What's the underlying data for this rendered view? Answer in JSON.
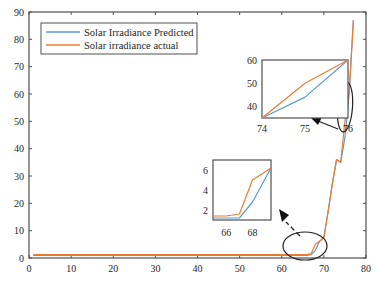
{
  "chart_data": [
    {
      "id": "main",
      "type": "line",
      "title": "",
      "xlabel": "",
      "ylabel": "",
      "xlim": [
        0,
        80
      ],
      "ylim": [
        0,
        90
      ],
      "xticks": [
        0,
        10,
        20,
        30,
        40,
        50,
        60,
        70,
        80
      ],
      "yticks": [
        0,
        10,
        20,
        30,
        40,
        50,
        60,
        70,
        80,
        90
      ],
      "grid": false,
      "legend_position": "upper left",
      "series": [
        {
          "name": "Solar Irradiance Predicted",
          "color": "#5b9bd5",
          "x": [
            1,
            10,
            20,
            30,
            40,
            50,
            60,
            65,
            66,
            67,
            68,
            69,
            70,
            71,
            72,
            73,
            74,
            75,
            76,
            77
          ],
          "y": [
            1,
            1,
            1,
            1,
            1,
            1,
            1,
            1,
            1,
            1.2,
            2.8,
            6.2,
            7.5,
            17,
            27,
            36,
            35,
            44,
            60,
            87
          ]
        },
        {
          "name": "Solar irradiance actual",
          "color": "#ed7d31",
          "x": [
            1,
            10,
            20,
            30,
            40,
            50,
            60,
            65,
            66,
            67,
            68,
            69,
            70,
            71,
            72,
            73,
            74,
            75,
            76,
            77
          ],
          "y": [
            1.2,
            1.2,
            1.2,
            1.2,
            1.2,
            1.2,
            1.2,
            1.2,
            1.2,
            1.6,
            5,
            6.2,
            7.5,
            17,
            27,
            36,
            35,
            50,
            60,
            87
          ]
        }
      ]
    },
    {
      "id": "inset-top",
      "type": "line",
      "xlim": [
        74,
        76
      ],
      "ylim": [
        35,
        60
      ],
      "xticks": [
        74,
        75,
        76
      ],
      "yticks": [
        40,
        50,
        60
      ],
      "series": [
        {
          "name": "Solar Irradiance Predicted",
          "color": "#5b9bd5",
          "x": [
            74,
            75,
            76
          ],
          "y": [
            35,
            44,
            60
          ]
        },
        {
          "name": "Solar irradiance actual",
          "color": "#ed7d31",
          "x": [
            74,
            75,
            76
          ],
          "y": [
            35,
            50,
            60
          ]
        }
      ]
    },
    {
      "id": "inset-bottom",
      "type": "line",
      "xlim": [
        65,
        69.4
      ],
      "ylim": [
        1,
        7
      ],
      "xticks": [
        66,
        68
      ],
      "yticks": [
        2,
        4,
        6
      ],
      "series": [
        {
          "name": "Solar Irradiance Predicted",
          "color": "#5b9bd5",
          "x": [
            65,
            66,
            67,
            68,
            69.4
          ],
          "y": [
            1.2,
            1.2,
            1.2,
            2.8,
            6.2
          ]
        },
        {
          "name": "Solar irradiance actual",
          "color": "#ed7d31",
          "x": [
            65,
            66,
            67,
            68,
            69.4
          ],
          "y": [
            1.4,
            1.4,
            1.6,
            5.0,
            6.2
          ]
        }
      ]
    }
  ],
  "legend": {
    "items": [
      {
        "label": "Solar Irradiance Predicted",
        "color": "#5b9bd5"
      },
      {
        "label": "Solar irradiance actual",
        "color": "#ed7d31"
      }
    ]
  },
  "colors": {
    "axis": "#505050",
    "text": "#262626",
    "predicted": "#5b9bd5",
    "actual": "#ed7d31"
  }
}
